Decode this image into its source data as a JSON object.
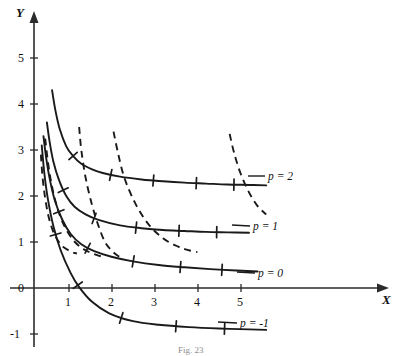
{
  "figure": {
    "caption": "Fig. 23",
    "axes": {
      "x_name": "X",
      "y_name": "Y",
      "x_ticks": [
        "1",
        "2",
        "3",
        "4",
        "5"
      ],
      "y_ticks": [
        "5",
        "4",
        "3",
        "2",
        "1",
        "0",
        "-1"
      ]
    }
  },
  "chart_data": {
    "type": "line",
    "title": "",
    "xlabel": "X",
    "ylabel": "Y",
    "xlim": [
      -0.15,
      8.1
    ],
    "ylim": [
      -1.45,
      5.9
    ],
    "grid": false,
    "legend_position": "right-inline",
    "x_ticks": [
      1,
      2,
      3,
      4,
      5
    ],
    "y_ticks": [
      -1,
      0,
      1,
      2,
      3,
      4,
      5
    ],
    "series": [
      {
        "name": "p = 2",
        "label": "p = 2",
        "style": "solid",
        "p": 2,
        "x": [
          0.42,
          0.5,
          0.6,
          0.75,
          0.9,
          1.1,
          1.35,
          1.6,
          2.0,
          2.5,
          3.0,
          3.5,
          4.0,
          4.5,
          5.0,
          5.4
        ],
        "y": [
          4.3,
          3.85,
          3.45,
          3.08,
          2.88,
          2.7,
          2.58,
          2.5,
          2.42,
          2.36,
          2.32,
          2.29,
          2.27,
          2.25,
          2.24,
          2.23
        ]
      },
      {
        "name": "p = 1",
        "label": "p = 1",
        "style": "solid",
        "p": 1,
        "x": [
          0.3,
          0.36,
          0.45,
          0.58,
          0.75,
          0.95,
          1.2,
          1.5,
          2.0,
          2.5,
          3.0,
          3.5,
          4.0,
          4.5,
          5.0
        ],
        "y": [
          3.6,
          3.2,
          2.75,
          2.35,
          2.0,
          1.76,
          1.6,
          1.48,
          1.36,
          1.3,
          1.26,
          1.24,
          1.22,
          1.21,
          1.2
        ]
      },
      {
        "name": "p = 0",
        "label": "p = 0",
        "style": "solid",
        "p": 0,
        "x": [
          0.22,
          0.28,
          0.36,
          0.48,
          0.65,
          0.85,
          1.1,
          1.4,
          1.8,
          2.3,
          2.9,
          3.5,
          4.1,
          4.7,
          5.2
        ],
        "y": [
          3.3,
          2.85,
          2.4,
          1.92,
          1.5,
          1.18,
          0.95,
          0.8,
          0.68,
          0.58,
          0.5,
          0.45,
          0.41,
          0.38,
          0.36
        ]
      },
      {
        "name": "p = -1",
        "label": "p = -1",
        "style": "solid",
        "p": -1,
        "x": [
          0.18,
          0.24,
          0.32,
          0.45,
          0.62,
          0.85,
          1.05,
          1.35,
          1.75,
          2.3,
          2.9,
          3.6,
          4.3,
          5.0,
          5.4
        ],
        "y": [
          3.1,
          2.5,
          1.95,
          1.35,
          0.82,
          0.33,
          0.02,
          -0.3,
          -0.55,
          -0.72,
          -0.8,
          -0.85,
          -0.88,
          -0.9,
          -0.91
        ]
      },
      {
        "name": "orthogonal-trajectory-1",
        "label": "",
        "style": "dashed",
        "x": [
          0.16,
          0.2,
          0.26,
          0.34,
          0.45,
          0.58,
          0.7,
          0.8,
          0.88,
          0.95,
          1.0
        ],
        "y": [
          2.9,
          2.4,
          1.95,
          1.55,
          1.22,
          1.0,
          0.88,
          0.82,
          0.78,
          0.76,
          0.75
        ]
      },
      {
        "name": "orthogonal-trajectory-2",
        "label": "",
        "style": "dashed",
        "x": [
          0.26,
          0.33,
          0.42,
          0.55,
          0.72,
          0.95,
          1.2,
          1.45,
          1.6
        ],
        "y": [
          3.25,
          2.7,
          2.2,
          1.72,
          1.32,
          1.0,
          0.82,
          0.72,
          0.68
        ]
      },
      {
        "name": "orthogonal-trajectory-3",
        "label": "",
        "style": "dashed",
        "x": [
          1.05,
          1.1,
          1.2,
          1.35,
          1.5,
          1.65,
          1.8,
          1.95,
          2.05
        ],
        "y": [
          3.5,
          3.0,
          2.4,
          1.8,
          1.35,
          1.0,
          0.82,
          0.7,
          0.66
        ]
      },
      {
        "name": "orthogonal-trajectory-4",
        "label": "",
        "style": "dashed",
        "x": [
          1.85,
          1.95,
          2.1,
          2.35,
          2.65,
          3.0,
          3.35,
          3.6,
          3.8
        ],
        "y": [
          3.4,
          2.95,
          2.4,
          1.85,
          1.4,
          1.08,
          0.9,
          0.82,
          0.78
        ]
      },
      {
        "name": "orthogonal-trajectory-5",
        "label": "",
        "style": "dashed",
        "x": [
          4.55,
          4.65,
          4.8,
          5.0,
          5.2,
          5.4
        ],
        "y": [
          3.35,
          2.95,
          2.5,
          2.08,
          1.78,
          1.6
        ]
      }
    ]
  }
}
